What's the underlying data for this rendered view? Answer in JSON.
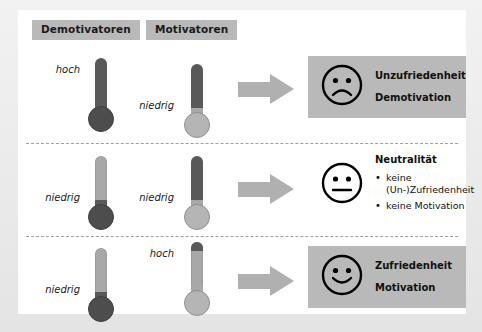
{
  "headers": {
    "left": "Demotivatoren",
    "right": "Motivatoren"
  },
  "labels": {
    "hoch": "hoch",
    "niedrig": "niedrig"
  },
  "colors": {
    "badge_bg": "#b9b9b9",
    "panel_bg": "#b9b9b9",
    "arrow": "#b0b0b0",
    "fill_dark": "#595959",
    "fill_light": "#a8a8a8",
    "bulb_dark": "#4d4d4d",
    "bulb_light": "#b5b5b5",
    "page_bg": "#e8e8e8",
    "card_bg": "#ffffff",
    "divider": "#9aa0a6"
  },
  "rows": [
    {
      "id": "row-dissatisfaction",
      "demotivator_level": "hoch",
      "motivator_level": "niedrig",
      "face": "sad-face",
      "panel_shaded": true,
      "title_lines": [
        "Unzufriedenheit",
        "Demotivation"
      ],
      "heading": null,
      "bullets": []
    },
    {
      "id": "row-neutrality",
      "demotivator_level": "niedrig",
      "motivator_level": "niedrig",
      "face": "neutral-face",
      "panel_shaded": false,
      "title_lines": [],
      "heading": "Neutralität",
      "bullets": [
        "keine (Un-)Zufriedenheit",
        "keine Motivation"
      ]
    },
    {
      "id": "row-satisfaction",
      "demotivator_level": "niedrig",
      "motivator_level": "hoch",
      "face": "happy-face",
      "panel_shaded": true,
      "title_lines": [
        "Zufriedenheit",
        "Motivation"
      ],
      "heading": null,
      "bullets": []
    }
  ]
}
